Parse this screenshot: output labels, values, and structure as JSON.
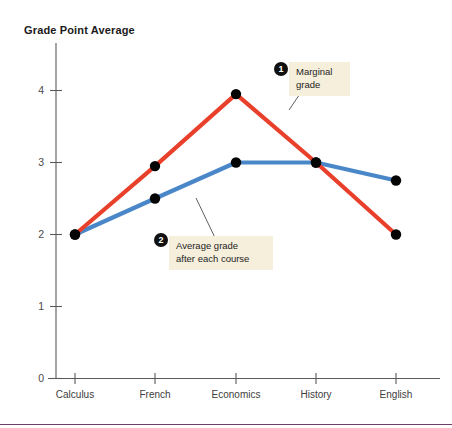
{
  "chart_data": {
    "type": "line",
    "title": "Grade Point Average",
    "xlabel": "",
    "ylabel": "Grade Point Average",
    "categories": [
      "Calculus",
      "French",
      "Economics",
      "History",
      "English"
    ],
    "ylim": [
      0,
      4.4
    ],
    "yticks": [
      0,
      1,
      2,
      3,
      4
    ],
    "ytick_labels": [
      "0",
      "1",
      "2",
      "3",
      "4"
    ],
    "grid": false,
    "legend": "none",
    "series": [
      {
        "name": "Marginal grade",
        "color": "#e8402a",
        "values": [
          2.0,
          2.95,
          3.95,
          3.0,
          2.0
        ]
      },
      {
        "name": "Average grade after each course",
        "color": "#4a87c8",
        "values": [
          2.0,
          2.5,
          3.0,
          3.0,
          2.75
        ]
      }
    ],
    "annotations": [
      {
        "badge": "1",
        "text": "Marginal\ngrade",
        "target_series": "Marginal grade"
      },
      {
        "badge": "2",
        "text": "Average grade\nafter each course",
        "target_series": "Average grade after each course"
      }
    ]
  },
  "colors": {
    "marginal": "#e8402a",
    "average": "#4a87c8",
    "marker": "#050505",
    "axis": "#5a5a5a",
    "callout_bg": "#f6efdc",
    "rule": "#6e3f6b"
  }
}
